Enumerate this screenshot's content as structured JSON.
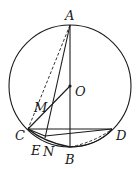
{
  "figure": {
    "points": {
      "A": "A",
      "O": "O",
      "M": "M",
      "C": "C",
      "D": "D",
      "E": "E",
      "N": "N",
      "B": "B"
    },
    "segments_solid": [
      "AB",
      "AN",
      "CO",
      "CD",
      "CB",
      "ND"
    ],
    "segments_dashed": [
      "AC",
      "BD"
    ],
    "colors": {
      "ink": "#1a1a1a",
      "background": "#ffffff"
    }
  }
}
